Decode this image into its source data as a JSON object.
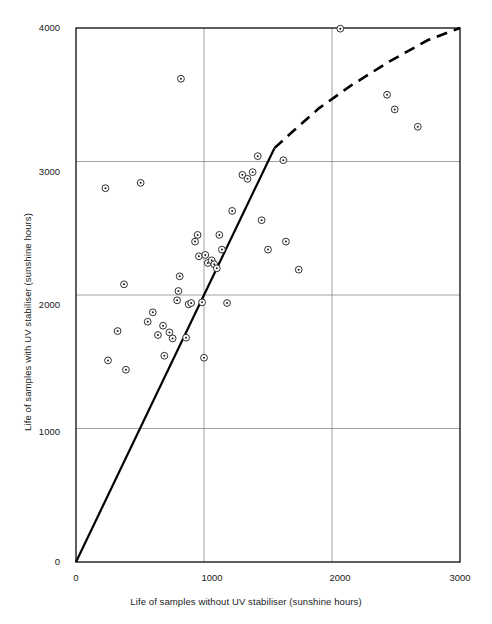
{
  "chart_data": {
    "type": "scatter",
    "title": "",
    "xlabel": "Life of samples without UV stabiliser (sunshine hours)",
    "ylabel": "Life of samples with UV stabiliser (sunshine hours)",
    "xlim": [
      0,
      3000
    ],
    "ylim": [
      0,
      4000
    ],
    "xticks": [
      0,
      1000,
      2000,
      3000
    ],
    "xtick_labels": [
      "0",
      "1000",
      "2000",
      "3000"
    ],
    "yticks": [
      0,
      1000,
      2000,
      3000,
      4000
    ],
    "ytick_labels": [
      "0",
      "1000",
      "2000",
      "3000",
      "4000"
    ],
    "grid": true,
    "grid_color": "#8a8a8a",
    "frame_color": "#1a1a1a",
    "marker": "circle-with-center-dot",
    "marker_color": "#1a1a1a",
    "legend": null,
    "points": [
      [
        230,
        2800
      ],
      [
        375,
        2080
      ],
      [
        250,
        1510
      ],
      [
        325,
        1730
      ],
      [
        390,
        1440
      ],
      [
        505,
        2840
      ],
      [
        560,
        1800
      ],
      [
        600,
        1870
      ],
      [
        640,
        1700
      ],
      [
        680,
        1770
      ],
      [
        690,
        1545
      ],
      [
        730,
        1720
      ],
      [
        755,
        1675
      ],
      [
        790,
        1960
      ],
      [
        800,
        2030
      ],
      [
        810,
        2140
      ],
      [
        820,
        3620
      ],
      [
        860,
        1680
      ],
      [
        880,
        1930
      ],
      [
        900,
        1940
      ],
      [
        930,
        2400
      ],
      [
        950,
        2450
      ],
      [
        960,
        2290
      ],
      [
        985,
        1945
      ],
      [
        1000,
        1530
      ],
      [
        1010,
        2300
      ],
      [
        1030,
        2240
      ],
      [
        1060,
        2260
      ],
      [
        1080,
        2230
      ],
      [
        1100,
        2200
      ],
      [
        1120,
        2450
      ],
      [
        1140,
        2340
      ],
      [
        1180,
        1940
      ],
      [
        1220,
        2630
      ],
      [
        1300,
        2900
      ],
      [
        1340,
        2870
      ],
      [
        1380,
        2920
      ],
      [
        1420,
        3040
      ],
      [
        1450,
        2560
      ],
      [
        1500,
        2340
      ],
      [
        1620,
        3010
      ],
      [
        1640,
        2400
      ],
      [
        1740,
        2190
      ],
      [
        2065,
        3995
      ],
      [
        2430,
        3500
      ],
      [
        2490,
        3390
      ],
      [
        2670,
        3260
      ]
    ],
    "lines": [
      {
        "name": "regression-solid-segment",
        "style": "solid",
        "width": 2.2,
        "color": "#000000",
        "points": [
          [
            0,
            0
          ],
          [
            1550,
            3100
          ]
        ]
      },
      {
        "name": "regression-dashed-extension",
        "style": "dashed",
        "width": 2.6,
        "color": "#000000",
        "dash": "11,7",
        "points": [
          [
            1550,
            3100
          ],
          [
            1700,
            3230
          ],
          [
            1900,
            3400
          ],
          [
            2150,
            3570
          ],
          [
            2450,
            3750
          ],
          [
            2750,
            3910
          ],
          [
            3000,
            4000
          ]
        ]
      }
    ]
  },
  "axes": {
    "x_title": "Life of samples without UV stabiliser (sunshine hours)",
    "y_title": "Life of samples with UV stabiliser (sunshine hours)",
    "x_tick_0": "0",
    "x_tick_1": "1000",
    "x_tick_2": "2000",
    "x_tick_3": "3000",
    "y_tick_0": "0",
    "y_tick_1": "1000",
    "y_tick_2": "2000",
    "y_tick_3": "3000",
    "y_tick_4": "4000"
  }
}
